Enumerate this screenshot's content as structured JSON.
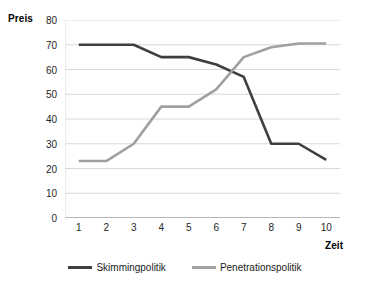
{
  "chart_data": {
    "type": "line",
    "title": "",
    "xlabel": "Zeit",
    "ylabel": "Preis",
    "categories": [
      "1",
      "2",
      "3",
      "4",
      "5",
      "6",
      "7",
      "8",
      "9",
      "10"
    ],
    "x": [
      1,
      2,
      3,
      4,
      5,
      6,
      7,
      8,
      9,
      10
    ],
    "ylim": [
      0,
      80
    ],
    "yticks": [
      0,
      10,
      20,
      30,
      40,
      50,
      60,
      70,
      80
    ],
    "ytick_labels": [
      "0",
      "10",
      "20",
      "30",
      "40",
      "50",
      "60",
      "70",
      "80"
    ],
    "grid": true,
    "grid_axis": "y",
    "legend_position": "bottom",
    "series": [
      {
        "name": "Skimmingpolitik",
        "color": "#3f3f3f",
        "values": [
          70,
          70,
          70,
          65,
          65,
          62,
          57,
          30,
          30,
          23.5
        ]
      },
      {
        "name": "Penetrationspolitik",
        "color": "#a0a0a0",
        "values": [
          23,
          23,
          30,
          45,
          45,
          52,
          65,
          69,
          70.5,
          70.5
        ]
      }
    ]
  },
  "axes": {
    "y_title": "Preis",
    "x_title": "Zeit"
  },
  "colors": {
    "skimming": "#3f3f3f",
    "penetration": "#a0a0a0",
    "grid": "#d9d9d9",
    "axis": "#808080",
    "background": "#ffffff"
  }
}
